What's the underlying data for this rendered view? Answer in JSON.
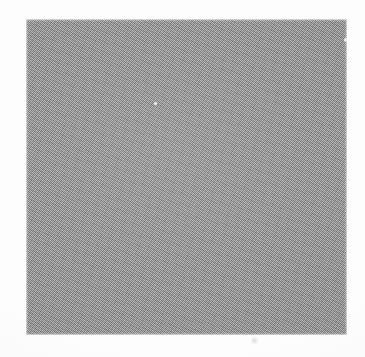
{
  "document": {
    "kind": "scanned-page",
    "canvas_width": 365,
    "canvas_height": 357,
    "page_background_color": "#fdfdfd",
    "visible_text": "",
    "caption": "",
    "notes": "No text, labels, icons, axes or UI chrome are rendered anywhere on the page."
  },
  "plate": {
    "shape": "rectangle",
    "label": "",
    "fill_color": "#9a9a9a",
    "x": 26,
    "y": 19,
    "width": 321,
    "height": 316,
    "right": 347,
    "bottom": 335,
    "border": "none",
    "edge_quality": "soft-irregular",
    "texture": "halftone-dither"
  },
  "artifacts": [
    {
      "name": "white-speck-center",
      "x": 155,
      "y": 103,
      "color": "#ffffff",
      "description": "tiny light speck inside the gray plate"
    },
    {
      "name": "light-speck-right-edge",
      "x": 345,
      "y": 40,
      "color": "#ffffff",
      "description": "small light notch near the right edge of the plate"
    },
    {
      "name": "faint-mark-below-plate",
      "x": 254,
      "y": 340,
      "color": "#aaacb0",
      "description": "very faint mark on the paper below the plate"
    }
  ]
}
